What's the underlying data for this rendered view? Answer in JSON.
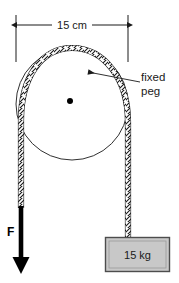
{
  "figure": {
    "dimension": {
      "label": "15 cm",
      "value": 15,
      "unit": "cm",
      "orientation": "horizontal",
      "measures": "peg diameter"
    },
    "annotations": {
      "peg_label_line1": "fixed",
      "peg_label_line2": "peg",
      "force_label": "F",
      "mass_label": "15 kg"
    },
    "colors": {
      "stroke": "#1a1a1a",
      "rope": "#1a1a1a",
      "background": "#ffffff",
      "block_fill": "#c8c8c8",
      "block_border": "#4d4d4d",
      "arrow": "#000000"
    },
    "elements": {
      "peg_circle": "fixed-peg-circle",
      "peg_center": "peg-center-dot",
      "rope": "rope-over-peg",
      "force_arrow": "downward-force-arrow",
      "mass_block": "hanging-mass-block"
    }
  }
}
